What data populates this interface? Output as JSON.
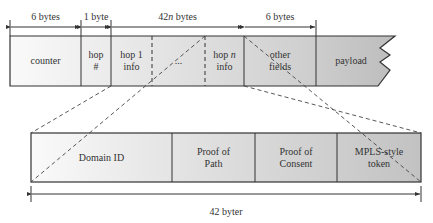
{
  "top_dimensions": [
    {
      "label": "6 bytes",
      "x1": 10,
      "x2": 81
    },
    {
      "label": "1 byte",
      "x1": 81,
      "x2": 111
    },
    {
      "label": "42n bytes",
      "x1": 111,
      "x2": 244
    },
    {
      "label": "6 bytes",
      "x1": 244,
      "x2": 316
    }
  ],
  "top_fields": [
    {
      "label": "counter"
    },
    {
      "label": "hop\n#"
    },
    {
      "label": "hop 1\ninfo"
    },
    {
      "label": "..."
    },
    {
      "label": "hop n\ninfo"
    },
    {
      "label": "other\nfields"
    },
    {
      "label": "payload"
    }
  ],
  "bottom_fields": [
    {
      "label": "Domain ID"
    },
    {
      "label": "Proof of\nPath"
    },
    {
      "label": "Proof of\nConsent"
    },
    {
      "label": "MPLS-style\ntoken"
    }
  ],
  "bottom_dimension": {
    "label": "42 byter"
  },
  "colors": {
    "light": "#f4f4f4",
    "mid": "#dcdcdc",
    "dark": "#c4c4c4",
    "stroke": "#333333"
  }
}
